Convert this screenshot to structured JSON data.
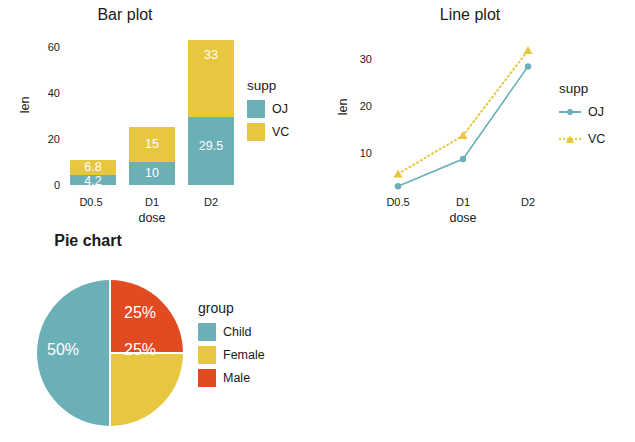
{
  "palette": {
    "teal": "#6BAFB7",
    "yellow": "#E7C73F",
    "orange": "#E24A21",
    "text": "#1a1a1a",
    "label_on_fill": "#ffffff"
  },
  "charts": {
    "bar": {
      "title": "Bar plot",
      "xlabel": "dose",
      "ylabel": "len",
      "legend_title": "supp",
      "yticks": [
        "0",
        "20",
        "40",
        "60"
      ],
      "xticks": [
        "D0.5",
        "D1",
        "D2"
      ],
      "series": [
        {
          "name": "OJ",
          "color": "#6BAFB7",
          "values": [
            4.2,
            10,
            29.5
          ],
          "labels": [
            "4.2",
            "10",
            "29.5"
          ]
        },
        {
          "name": "VC",
          "color": "#E7C73F",
          "values": [
            6.8,
            15,
            33
          ],
          "labels": [
            "6.8",
            "15",
            "33"
          ]
        }
      ]
    },
    "line": {
      "title": "Line plot",
      "xlabel": "dose",
      "ylabel": "len",
      "legend_title": "supp",
      "yticks": [
        "10",
        "20",
        "30"
      ],
      "xticks": [
        "D0.5",
        "D1",
        "D2"
      ],
      "series": [
        {
          "name": "OJ",
          "color": "#6BAFB7",
          "marker": "circle",
          "linestyle": "solid",
          "values": [
            4.2,
            10,
            29.5
          ]
        },
        {
          "name": "VC",
          "color": "#E7C73F",
          "marker": "triangle",
          "linestyle": "dotted",
          "values": [
            6.8,
            15,
            33
          ]
        }
      ]
    },
    "pie": {
      "title": "Pie chart",
      "legend_title": "group",
      "slices": [
        {
          "name": "Child",
          "color": "#6BAFB7",
          "percent": 50,
          "label": "50%"
        },
        {
          "name": "Female",
          "color": "#E7C73F",
          "percent": 25,
          "label": "25%"
        },
        {
          "name": "Male",
          "color": "#E24A21",
          "percent": 25,
          "label": "25%"
        }
      ]
    }
  },
  "caption": ""
}
